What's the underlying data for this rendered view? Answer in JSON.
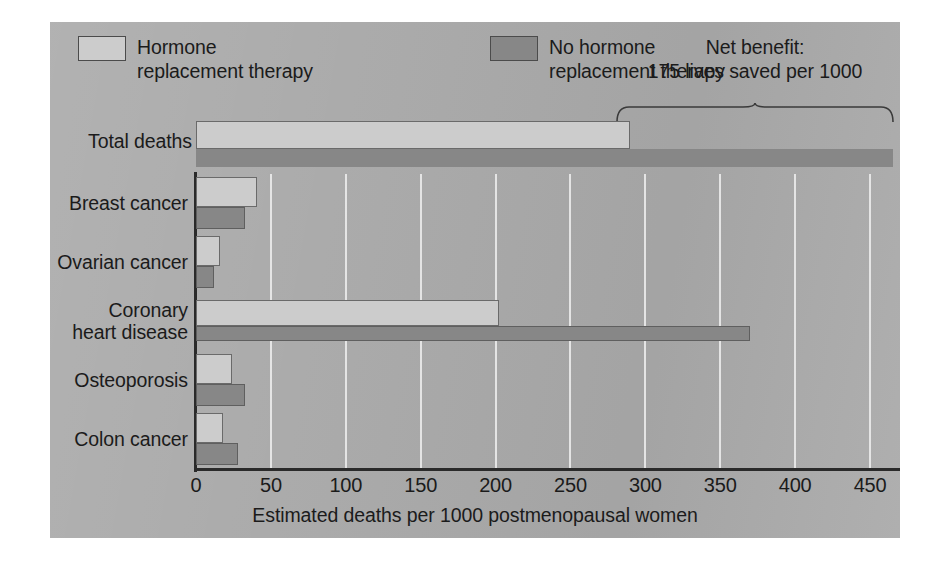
{
  "legend": {
    "hrt": {
      "label": "Hormone\nreplacement therapy",
      "color": "#cccccc",
      "swatch_name": "light-gray-swatch"
    },
    "no_hrt": {
      "label": "No hormone\nreplacement therapy",
      "color": "#878787",
      "swatch_name": "dark-gray-swatch"
    }
  },
  "annotation": {
    "net_benefit": "Net benefit:\n175 lives saved per 1000",
    "net_benefit_value": 175
  },
  "axis": {
    "ticks": [
      "0",
      "50",
      "100",
      "150",
      "200",
      "250",
      "300",
      "350",
      "400",
      "450"
    ],
    "xlabel": "Estimated deaths per 1000 postmenopausal women"
  },
  "summary_row": {
    "label": "Total deaths",
    "hrt": 290,
    "no_hrt": 465
  },
  "rows": [
    {
      "label": "Breast cancer",
      "hrt": 41,
      "no_hrt": 33
    },
    {
      "label": "Ovarian cancer",
      "hrt": 16,
      "no_hrt": 12
    },
    {
      "label": "Coronary\nheart disease",
      "hrt": 202,
      "no_hrt": 370
    },
    {
      "label": "Osteoporosis",
      "hrt": 24,
      "no_hrt": 33
    },
    {
      "label": "Colon cancer",
      "hrt": 18,
      "no_hrt": 28
    }
  ],
  "colors": {
    "panel_background": "#a9a9a9",
    "gridline": "#e9e9e9",
    "axis": "#2a2a2a",
    "text": "#1b1b1b",
    "hrt_bar": "#cccccc",
    "no_hrt_bar": "#878787"
  },
  "chart_data": {
    "type": "bar",
    "title": "",
    "subtitle": "",
    "orientation": "horizontal",
    "grouped": true,
    "xlabel": "Estimated deaths per 1000 postmenopausal women",
    "ylabel": "",
    "xlim": [
      0,
      470
    ],
    "xticks": [
      0,
      50,
      100,
      150,
      200,
      250,
      300,
      350,
      400,
      450
    ],
    "grid": "vertical gridlines at every 50 units, white on gray panel",
    "legend": {
      "position": "top",
      "entries": [
        "Hormone replacement therapy",
        "No hormone replacement therapy"
      ]
    },
    "categories": [
      "Total deaths",
      "Breast cancer",
      "Ovarian cancer",
      "Coronary heart disease",
      "Osteoporosis",
      "Colon cancer"
    ],
    "series": [
      {
        "name": "Hormone replacement therapy",
        "color": "#cccccc",
        "values": [
          290,
          41,
          16,
          202,
          24,
          18
        ]
      },
      {
        "name": "No hormone replacement therapy",
        "color": "#878787",
        "values": [
          465,
          33,
          12,
          370,
          33,
          28
        ]
      }
    ],
    "annotations": [
      {
        "text": "Net benefit: 175 lives saved per 1000",
        "target": "Total deaths",
        "span": [
          290,
          465
        ],
        "marker": "curly-brace"
      }
    ]
  }
}
